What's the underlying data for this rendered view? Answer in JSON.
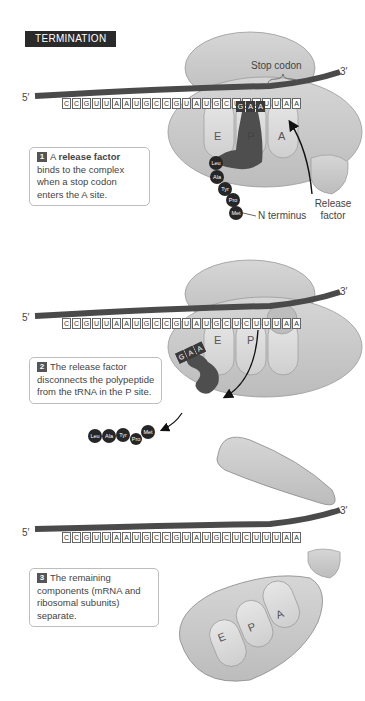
{
  "title": "TERMINATION",
  "panels": [
    {
      "step": "1",
      "text_parts": [
        "A ",
        "release factor",
        " binds to the complex when a stop codon enters the A site."
      ],
      "mrna": {
        "five_prime": "5′",
        "three_prime": "3′",
        "sequence": [
          "C",
          "C",
          "G",
          "U",
          "U",
          "A",
          "A",
          "U",
          "G",
          "C",
          "C",
          "G",
          "U",
          "A",
          "U",
          "G",
          "C",
          "U",
          "C",
          "U",
          "U",
          "U",
          "A",
          "A"
        ]
      },
      "anticodon": [
        "G",
        "A",
        "A"
      ],
      "sites": [
        "E",
        "P",
        "A"
      ],
      "labels": {
        "stop_codon": "Stop codon",
        "n_terminus": "N terminus",
        "release_factor": "Release factor"
      },
      "amino_acids": [
        "Leu",
        "Ala",
        "Tyr",
        "Pro",
        "Met"
      ]
    },
    {
      "step": "2",
      "text": "The release factor disconnects the polypeptide from the tRNA in the P site.",
      "mrna": {
        "five_prime": "5′",
        "three_prime": "3′",
        "sequence": [
          "C",
          "C",
          "G",
          "U",
          "U",
          "A",
          "A",
          "U",
          "G",
          "C",
          "C",
          "G",
          "U",
          "A",
          "U",
          "G",
          "C",
          "U",
          "C",
          "U",
          "U",
          "U",
          "A",
          "A"
        ]
      },
      "anticodon": [
        "G",
        "A",
        "A"
      ],
      "sites": [
        "E",
        "P"
      ],
      "amino_acids": [
        "Leu",
        "Ala",
        "Tyr",
        "Pro",
        "Met"
      ]
    },
    {
      "step": "3",
      "text": "The remaining components (mRNA and ribosomal subunits) separate.",
      "mrna": {
        "five_prime": "5′",
        "three_prime": "3′",
        "sequence": [
          "C",
          "C",
          "G",
          "U",
          "U",
          "A",
          "A",
          "U",
          "G",
          "C",
          "C",
          "G",
          "U",
          "A",
          "U",
          "G",
          "C",
          "U",
          "C",
          "U",
          "U",
          "U",
          "A",
          "A"
        ]
      },
      "sites": [
        "E",
        "P",
        "A"
      ]
    }
  ],
  "colors": {
    "ribosome": "#cfcfcf",
    "ribosome_edge": "#8a8a8a",
    "trna": "#5a5a5a",
    "mrna": "#4a4a4a",
    "amino_acid": "#262626",
    "title_bg": "#2a2a2a"
  }
}
